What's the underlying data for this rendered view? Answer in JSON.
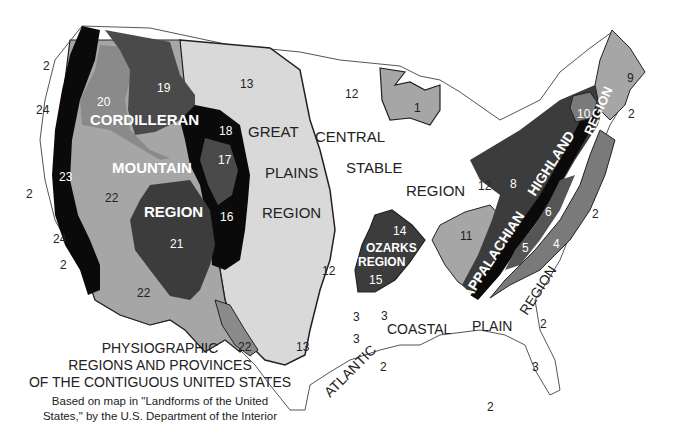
{
  "title": {
    "line1": "PHYSIOGRAPHIC",
    "line2": "REGIONS AND PROVINCES",
    "line3": "OF THE CONTIGUOUS UNITED STATES"
  },
  "source": {
    "line1": "Based on map in \"Landforms of the United",
    "line2": "States,\" by the U.S. Department of the Interior"
  },
  "colors": {
    "white": "#ffffff",
    "light": "#d9d9d9",
    "medium": "#a6a6a6",
    "dark": "#555555",
    "darker": "#3c3c3c",
    "black": "#0a0a0a",
    "outline": "#222222"
  },
  "regions": {
    "cordilleran": [
      "CORDILLERAN",
      "MOUNTAIN",
      "REGION"
    ],
    "great_plains": [
      "GREAT",
      "PLAINS",
      "REGION"
    ],
    "central_stable": [
      "CENTRAL",
      "STABLE",
      "REGION"
    ],
    "ozarks": [
      "OZARKS",
      "REGION"
    ],
    "appalachian": [
      "APPALACHIAN",
      "HIGHLAND",
      "REGION"
    ],
    "coastal": [
      "ATLANTIC",
      "COASTAL",
      "PLAIN",
      "REGION"
    ]
  },
  "provinces": {
    "p1": "1",
    "p2": "2",
    "p3": "3",
    "p4": "4",
    "p5": "5",
    "p6": "6",
    "p8": "8",
    "p9": "9",
    "p10": "10",
    "p11": "11",
    "p12": "12",
    "p13": "13",
    "p14": "14",
    "p15": "15",
    "p16": "16",
    "p17": "17",
    "p18": "18",
    "p19": "19",
    "p20": "20",
    "p21": "21",
    "p22": "22",
    "p23": "23",
    "p24": "24"
  }
}
